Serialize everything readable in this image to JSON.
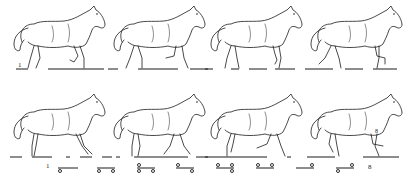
{
  "figure": {
    "ink_color": "#1a1a1a",
    "background": "#ffffff",
    "rows": [
      {
        "id": "row-1",
        "phases": [
          {
            "index": 1,
            "x": 8,
            "y": 2,
            "ground": [
              [
                8,
                20
              ],
              [
                40,
                96
              ]
            ]
          },
          {
            "index": 2,
            "x": 108,
            "y": 2,
            "ground": [
              [
                0,
                10
              ],
              [
                30,
                70
              ],
              [
                82,
                100
              ]
            ]
          },
          {
            "index": 3,
            "x": 205,
            "y": 2,
            "ground": [
              [
                0,
                8
              ],
              [
                26,
                34
              ],
              [
                44,
                62
              ],
              [
                70,
                90
              ]
            ]
          },
          {
            "index": 4,
            "x": 305,
            "y": 2,
            "ground": [
              [
                0,
                28
              ],
              [
                40,
                58
              ],
              [
                68,
                92
              ]
            ]
          }
        ],
        "start_label": "1"
      },
      {
        "id": "row-2",
        "phases": [
          {
            "index": 5,
            "x": 8,
            "y": 90,
            "ground": [
              [
                2,
                14
              ],
              [
                24,
                44
              ],
              [
                58,
                62
              ],
              [
                72,
                84
              ],
              [
                94,
                100
              ]
            ]
          },
          {
            "index": 6,
            "x": 108,
            "y": 90,
            "ground": [
              [
                0,
                4
              ],
              [
                8,
                12
              ],
              [
                26,
                80
              ],
              [
                88,
                100
              ]
            ]
          },
          {
            "index": 7,
            "x": 205,
            "y": 90,
            "ground": [
              [
                0,
                62
              ],
              [
                82,
                86
              ]
            ]
          },
          {
            "index": 8,
            "x": 305,
            "y": 90,
            "ground": [
              [
                2,
                30
              ],
              [
                58,
                94
              ]
            ]
          }
        ],
        "end_marker": "8"
      }
    ],
    "notation": {
      "start_label": "1",
      "end_label": "8",
      "diagrams": [
        {
          "index": 1,
          "x": 58,
          "bar": [
            0,
            20
          ],
          "marks": [
            {
              "cx": 2,
              "pos": "below"
            }
          ]
        },
        {
          "index": 2,
          "x": 97,
          "bar": [
            0,
            18
          ],
          "marks": [
            {
              "cx": 2,
              "pos": "below"
            },
            {
              "cx": 16,
              "pos": "below"
            }
          ]
        },
        {
          "index": 3,
          "x": 137,
          "bar": [
            0,
            18
          ],
          "marks": [
            {
              "cx": 2,
              "pos": "above"
            },
            {
              "cx": 2,
              "pos": "below"
            },
            {
              "cx": 16,
              "pos": "below"
            }
          ]
        },
        {
          "index": 4,
          "x": 176,
          "bar": [
            0,
            18
          ],
          "marks": [
            {
              "cx": 2,
              "pos": "above"
            },
            {
              "cx": 16,
              "pos": "below"
            }
          ]
        },
        {
          "index": 5,
          "x": 216,
          "bar": [
            0,
            18
          ],
          "marks": [
            {
              "cx": 2,
              "pos": "above"
            },
            {
              "cx": 16,
              "pos": "above"
            },
            {
              "cx": 16,
              "pos": "below"
            }
          ]
        },
        {
          "index": 6,
          "x": 256,
          "bar": [
            0,
            18
          ],
          "marks": [
            {
              "cx": 2,
              "pos": "above"
            },
            {
              "cx": 16,
              "pos": "above"
            }
          ]
        },
        {
          "index": 7,
          "x": 296,
          "bar": [
            0,
            18
          ],
          "marks": [
            {
              "cx": 16,
              "pos": "above"
            }
          ]
        },
        {
          "index": 8,
          "x": 336,
          "bar": [
            0,
            18
          ],
          "marks": [
            {
              "cx": 16,
              "pos": "above"
            },
            {
              "cx": 2,
              "pos": "below"
            }
          ]
        }
      ]
    }
  }
}
